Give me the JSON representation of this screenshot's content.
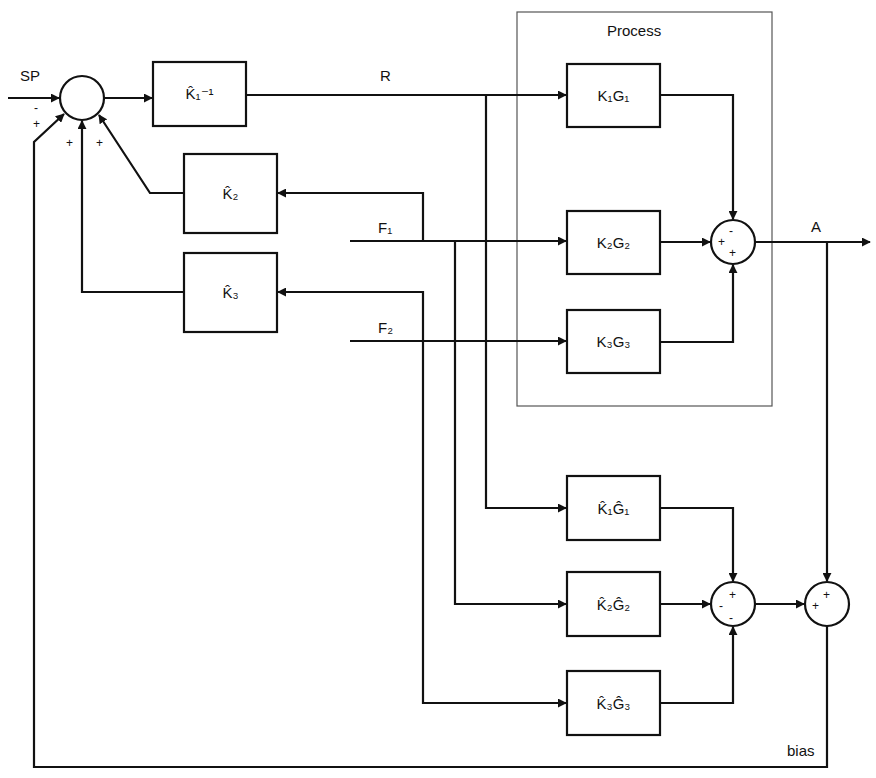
{
  "diagram": {
    "type": "block-diagram",
    "colors": {
      "line": "#111111",
      "frame": "#555555",
      "background": "#ffffff"
    },
    "signals": {
      "sp": "SP",
      "r": "R",
      "f1": "F₁",
      "f2": "F₂",
      "a": "A",
      "bias": "bias"
    },
    "process_label": "Process",
    "blocks": {
      "k1_inv": "K̂₁⁻¹",
      "k2_hat": "K̂₂",
      "k3_hat": "K̂₃",
      "k1g1": "K₁G₁",
      "k2g2": "K₂G₂",
      "k3g3": "K₃G₃",
      "k1g1_hat": "K̂₁Ĝ₁",
      "k2g2_hat": "K̂₂Ĝ₂",
      "k3g3_hat": "K̂₃Ĝ₃"
    },
    "summing_junctions": {
      "input": {
        "signs": [
          "-",
          "+",
          "+",
          "+"
        ]
      },
      "process": {
        "signs": [
          "-",
          "+",
          "+"
        ]
      },
      "model": {
        "signs": [
          "+",
          "-",
          "-"
        ]
      },
      "bias": {
        "signs": [
          "+",
          "+"
        ]
      }
    }
  }
}
